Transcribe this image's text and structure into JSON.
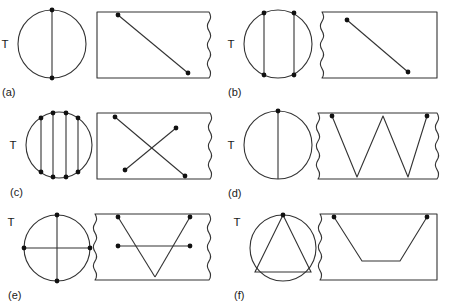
{
  "figure": {
    "title": "",
    "stroke_color": "#333333",
    "dot_color": "#111111",
    "background": "#ffffff"
  },
  "panels": [
    {
      "id": "a",
      "caption": "(a)",
      "t_label": "T",
      "circle": {
        "cx": 52,
        "cy": 44,
        "r": 34,
        "chords": [
          {
            "x1": 52,
            "y1": 10,
            "x2": 52,
            "y2": 78
          }
        ],
        "dots": [
          {
            "x": 52,
            "y": 10
          },
          {
            "x": 52,
            "y": 78
          }
        ]
      },
      "rect": {
        "x": 97,
        "y": 12,
        "w": 112,
        "h": 66,
        "wavy_left": false,
        "wavy_right": true,
        "lines": [
          {
            "x1": 118,
            "y1": 15,
            "x2": 188,
            "y2": 73
          }
        ],
        "dots": [
          {
            "x": 118,
            "y": 15
          },
          {
            "x": 188,
            "y": 73
          }
        ]
      }
    },
    {
      "id": "b",
      "caption": "(b)",
      "t_label": "T",
      "circle": {
        "cx": 278,
        "cy": 44,
        "r": 34,
        "chords": [
          {
            "x1": 264,
            "y1": 13,
            "x2": 264,
            "y2": 75
          },
          {
            "x1": 294,
            "y1": 13,
            "x2": 294,
            "y2": 75
          }
        ],
        "dots": [
          {
            "x": 264,
            "y": 13
          },
          {
            "x": 264,
            "y": 75
          },
          {
            "x": 294,
            "y": 13
          },
          {
            "x": 294,
            "y": 75
          }
        ]
      },
      "rect": {
        "x": 322,
        "y": 12,
        "w": 115,
        "h": 66,
        "wavy_left": true,
        "wavy_right": false,
        "lines": [
          {
            "x1": 347,
            "y1": 20,
            "x2": 408,
            "y2": 72
          }
        ],
        "dots": [
          {
            "x": 347,
            "y": 20
          },
          {
            "x": 408,
            "y": 72
          }
        ]
      }
    },
    {
      "id": "c",
      "caption": "(c)",
      "t_label": "T",
      "circle": {
        "cx": 59,
        "cy": 145,
        "r": 33,
        "chords": [
          {
            "x1": 41,
            "y1": 118,
            "x2": 41,
            "y2": 172
          },
          {
            "x1": 53,
            "y1": 113,
            "x2": 53,
            "y2": 177
          },
          {
            "x1": 66,
            "y1": 113,
            "x2": 66,
            "y2": 177
          },
          {
            "x1": 78,
            "y1": 118,
            "x2": 78,
            "y2": 172
          }
        ],
        "dots": [
          {
            "x": 41,
            "y": 118
          },
          {
            "x": 41,
            "y": 172
          },
          {
            "x": 53,
            "y": 113
          },
          {
            "x": 53,
            "y": 177
          },
          {
            "x": 66,
            "y": 113
          },
          {
            "x": 66,
            "y": 177
          },
          {
            "x": 78,
            "y": 118
          },
          {
            "x": 78,
            "y": 172
          }
        ]
      },
      "rect": {
        "x": 97,
        "y": 113,
        "w": 113,
        "h": 66,
        "wavy_left": false,
        "wavy_right": true,
        "lines": [
          {
            "x1": 115,
            "y1": 117,
            "x2": 185,
            "y2": 176
          },
          {
            "x1": 125,
            "y1": 170,
            "x2": 176,
            "y2": 128
          }
        ],
        "dots": [
          {
            "x": 115,
            "y": 117
          },
          {
            "x": 185,
            "y": 176
          },
          {
            "x": 125,
            "y": 170
          },
          {
            "x": 176,
            "y": 128
          }
        ]
      }
    },
    {
      "id": "d",
      "caption": "(d)",
      "t_label": "T",
      "circle": {
        "cx": 278,
        "cy": 145,
        "r": 34,
        "chords": [
          {
            "x1": 278,
            "y1": 111,
            "x2": 278,
            "y2": 179
          }
        ],
        "dots": [
          {
            "x": 278,
            "y": 111
          }
        ]
      },
      "rect": {
        "x": 318,
        "y": 113,
        "w": 119,
        "h": 66,
        "wavy_left": true,
        "wavy_right": true,
        "polyline": [
          {
            "x": 332,
            "y": 116
          },
          {
            "x": 357,
            "y": 177
          },
          {
            "x": 383,
            "y": 116
          },
          {
            "x": 408,
            "y": 177
          },
          {
            "x": 427,
            "y": 116
          }
        ],
        "dots": [
          {
            "x": 332,
            "y": 116
          },
          {
            "x": 427,
            "y": 116
          }
        ]
      }
    },
    {
      "id": "e",
      "caption": "(e)",
      "t_label": "T",
      "circle": {
        "cx": 57,
        "cy": 248,
        "r": 33,
        "chords": [
          {
            "x1": 57,
            "y1": 215,
            "x2": 57,
            "y2": 281
          },
          {
            "x1": 24,
            "y1": 248,
            "x2": 90,
            "y2": 248
          }
        ],
        "dots": [
          {
            "x": 57,
            "y": 215
          },
          {
            "x": 57,
            "y": 281
          },
          {
            "x": 24,
            "y": 248
          },
          {
            "x": 90,
            "y": 248
          }
        ]
      },
      "rect": {
        "x": 95,
        "y": 214,
        "w": 114,
        "h": 66,
        "wavy_left": true,
        "wavy_right": true,
        "lines": [
          {
            "x1": 118,
            "y1": 217,
            "x2": 155,
            "y2": 277
          },
          {
            "x1": 155,
            "y1": 277,
            "x2": 190,
            "y2": 217
          },
          {
            "x1": 118,
            "y1": 246,
            "x2": 190,
            "y2": 246
          }
        ],
        "dots": [
          {
            "x": 118,
            "y": 217
          },
          {
            "x": 190,
            "y": 217
          },
          {
            "x": 118,
            "y": 246
          },
          {
            "x": 190,
            "y": 246
          }
        ]
      }
    },
    {
      "id": "f",
      "caption": "(f)",
      "t_label": "T",
      "circle": {
        "cx": 283,
        "cy": 248,
        "r": 33,
        "triangle": [
          {
            "x": 283,
            "y": 215
          },
          {
            "x": 255,
            "y": 272
          },
          {
            "x": 311,
            "y": 272
          }
        ],
        "dots": [
          {
            "x": 283,
            "y": 215
          }
        ]
      },
      "rect": {
        "x": 320,
        "y": 214,
        "w": 117,
        "h": 66,
        "wavy_left": true,
        "wavy_right": false,
        "polyline": [
          {
            "x": 334,
            "y": 217
          },
          {
            "x": 362,
            "y": 261
          },
          {
            "x": 400,
            "y": 261
          },
          {
            "x": 427,
            "y": 217
          }
        ],
        "dots": [
          {
            "x": 334,
            "y": 217
          },
          {
            "x": 427,
            "y": 217
          }
        ]
      }
    }
  ]
}
